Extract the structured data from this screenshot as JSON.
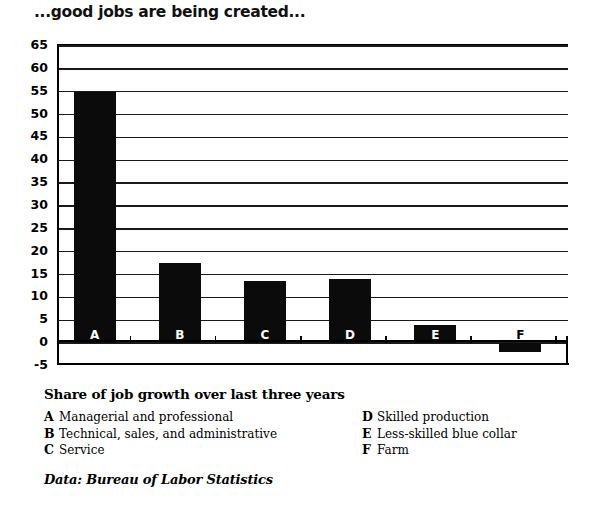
{
  "chart_data": {
    "type": "bar",
    "title": "...good jobs are being created...",
    "subtitle": "Share of job growth over last three years",
    "xlabel": "",
    "ylabel": "",
    "categories": [
      "A",
      "B",
      "C",
      "D",
      "E",
      "F"
    ],
    "values": [
      55,
      17.5,
      13.5,
      14,
      4,
      -2
    ],
    "ylim": [
      -5,
      65
    ],
    "ytick_step": 5,
    "yticks": [
      "65",
      "60",
      "55",
      "50",
      "45",
      "40",
      "35",
      "30",
      "25",
      "20",
      "15",
      "10",
      "5",
      "0",
      "-5"
    ],
    "grid": true,
    "legend_position": "below",
    "series": [
      {
        "name": "Share of job growth over last three years",
        "values": [
          55,
          17.5,
          13.5,
          14,
          4,
          -2
        ]
      }
    ],
    "legend_entries": [
      {
        "key": "A",
        "label": "Managerial and professional",
        "value": 55
      },
      {
        "key": "B",
        "label": "Technical, sales, and administrative",
        "value": 17.5
      },
      {
        "key": "C",
        "label": "Service",
        "value": 13.5
      },
      {
        "key": "D",
        "label": "Skilled production",
        "value": 14
      },
      {
        "key": "E",
        "label": "Less-skilled blue collar",
        "value": 4
      },
      {
        "key": "F",
        "label": "Farm",
        "value": -2
      }
    ],
    "source": "Data: Bureau of Labor Statistics",
    "bar_color": "#0b0b0b",
    "background_color": "#ffffff"
  },
  "chart": {
    "title": "...good jobs are being created...",
    "legend_title": "Share of job growth over last three years",
    "source": "Data: Bureau of Labor Statistics",
    "bars": [
      {
        "letter": "A",
        "value": 55
      },
      {
        "letter": "B",
        "value": 17.5
      },
      {
        "letter": "C",
        "value": 13.5
      },
      {
        "letter": "D",
        "value": 14
      },
      {
        "letter": "E",
        "value": 4
      },
      {
        "letter": "F",
        "value": -2
      }
    ],
    "legend_left": [
      {
        "key": "A",
        "label": "Managerial and professional"
      },
      {
        "key": "B",
        "label": "Technical, sales, and administrative"
      },
      {
        "key": "C",
        "label": "Service"
      }
    ],
    "legend_right": [
      {
        "key": "D",
        "label": "Skilled production"
      },
      {
        "key": "E",
        "label": "Less-skilled blue collar"
      },
      {
        "key": "F",
        "label": "Farm"
      }
    ]
  }
}
